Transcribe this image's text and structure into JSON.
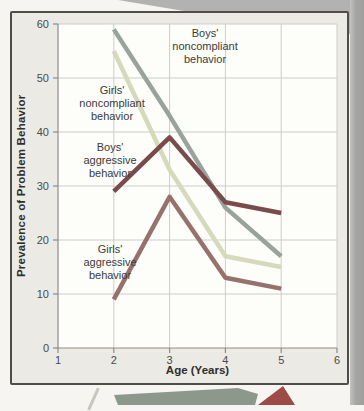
{
  "chart_data": {
    "type": "line",
    "xlabel": "Age (Years)",
    "ylabel": "Prevalence of Problem Behavior",
    "x": [
      2,
      3,
      4,
      5
    ],
    "xlim": [
      1,
      6
    ],
    "ylim": [
      0,
      60
    ],
    "xticks": [
      1,
      2,
      3,
      4,
      5,
      6
    ],
    "yticks": [
      0,
      10,
      20,
      30,
      40,
      50,
      60
    ],
    "grid": true,
    "legend_position": "inline-annotations",
    "grid_color": "#cbcec9",
    "axis_color": "#8b8c8a",
    "tick_label_color": "#4a4a48",
    "plot_bg_color": "#fdfdfa",
    "series": [
      {
        "name": "Boys' noncompliant behavior",
        "label": "Boys'\nnoncompliant\nbehavior",
        "values": [
          59,
          43,
          26,
          17
        ],
        "color": "#99a39c"
      },
      {
        "name": "Girls' noncompliant behavior",
        "label": "Girls'\nnoncompliant\nbehavior",
        "values": [
          55,
          33,
          17,
          15
        ],
        "color": "#d6dabb"
      },
      {
        "name": "Boys' aggressive behavior",
        "label": "Boys'\naggressive\nbehavior",
        "values": [
          29,
          39,
          27,
          25
        ],
        "color": "#7a4b4c"
      },
      {
        "name": "Girls' aggressive behavior",
        "label": "Girls'\naggressive\nbehavior",
        "values": [
          9,
          28,
          13,
          11
        ],
        "color": "#97716d"
      }
    ]
  },
  "decor": {
    "arrow_color": "#8c988c",
    "triangle_color": "#9c4b48"
  }
}
